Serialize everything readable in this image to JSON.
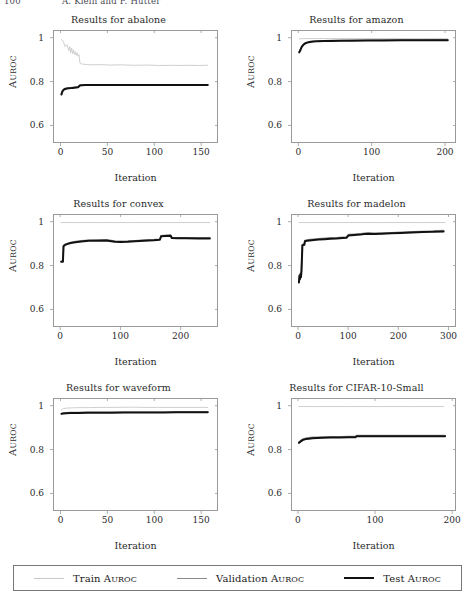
{
  "page": {
    "folio": "100",
    "running_head": "A. Klein and F. Hutter"
  },
  "legend": {
    "entries": [
      {
        "label": "Train AUROC",
        "color": "#c9c9c9",
        "width": 0.9
      },
      {
        "label": "Validation AUROC",
        "color": "#8a8a8a",
        "width": 1.5
      },
      {
        "label": "Test AUROC",
        "color": "#111111",
        "width": 2.0
      }
    ]
  },
  "chart_data": [
    {
      "type": "line",
      "title": "Results for abalone",
      "xlabel": "Iteration",
      "ylabel": "AUROC",
      "xlim": [
        -8,
        168
      ],
      "ylim": [
        0.52,
        1.035
      ],
      "xticks": [
        0,
        50,
        100,
        150
      ],
      "yticks": [
        0.6,
        0.8,
        1
      ],
      "ytick_labels": [
        "0.6",
        "0.8",
        "1"
      ],
      "grid": false,
      "series": [
        {
          "name": "Train AUROC",
          "color": "#c9c9c9",
          "width": 0.9,
          "x": [
            0,
            2,
            4,
            6,
            8,
            9,
            10,
            11,
            12,
            13,
            14,
            15,
            16,
            17,
            18,
            19,
            20,
            21,
            22,
            24,
            28,
            34,
            42,
            52,
            64,
            78,
            92,
            106,
            118,
            128,
            138,
            148,
            158
          ],
          "y": [
            0.995,
            0.988,
            0.962,
            0.972,
            0.944,
            0.962,
            0.935,
            0.955,
            0.93,
            0.948,
            0.926,
            0.94,
            0.922,
            0.934,
            0.918,
            0.925,
            0.886,
            0.884,
            0.882,
            0.881,
            0.879,
            0.878,
            0.879,
            0.877,
            0.878,
            0.876,
            0.877,
            0.875,
            0.876,
            0.875,
            0.876,
            0.875,
            0.876
          ]
        },
        {
          "name": "Validation AUROC",
          "color": "#8a8a8a",
          "width": 1.5,
          "x": [
            0,
            1,
            2,
            3,
            4,
            6,
            8,
            10,
            12,
            14,
            16,
            18,
            20,
            22,
            26,
            32,
            40,
            52,
            66,
            82,
            100,
            118,
            136,
            158
          ],
          "y": [
            0.742,
            0.756,
            0.762,
            0.766,
            0.768,
            0.77,
            0.771,
            0.772,
            0.773,
            0.774,
            0.775,
            0.776,
            0.784,
            0.785,
            0.785,
            0.786,
            0.786,
            0.786,
            0.786,
            0.786,
            0.786,
            0.786,
            0.786,
            0.786
          ]
        },
        {
          "name": "Test AUROC",
          "color": "#111111",
          "width": 2.0,
          "x": [
            0,
            1,
            2,
            3,
            4,
            6,
            8,
            10,
            12,
            14,
            16,
            18,
            20,
            22,
            26,
            32,
            40,
            52,
            66,
            82,
            100,
            118,
            136,
            158
          ],
          "y": [
            0.74,
            0.754,
            0.76,
            0.764,
            0.766,
            0.768,
            0.769,
            0.77,
            0.771,
            0.772,
            0.773,
            0.774,
            0.782,
            0.783,
            0.784,
            0.784,
            0.784,
            0.784,
            0.784,
            0.784,
            0.784,
            0.784,
            0.784,
            0.784
          ]
        }
      ]
    },
    {
      "type": "line",
      "title": "Results for amazon",
      "xlabel": "Iteration",
      "ylabel": "AUROC",
      "xlim": [
        -10,
        215
      ],
      "ylim": [
        0.52,
        1.035
      ],
      "xticks": [
        0,
        100,
        200
      ],
      "yticks": [
        0.6,
        0.8,
        1
      ],
      "ytick_labels": [
        "0.6",
        "0.8",
        "1"
      ],
      "grid": false,
      "series": [
        {
          "name": "Train AUROC",
          "color": "#c9c9c9",
          "width": 0.9,
          "x": [
            0,
            4,
            10,
            20,
            40,
            80,
            120,
            160,
            205
          ],
          "y": [
            0.999,
            0.999,
            1.0,
            1.0,
            1.0,
            1.0,
            1.0,
            1.0,
            1.0
          ]
        },
        {
          "name": "Validation AUROC",
          "color": "#8a8a8a",
          "width": 1.5,
          "x": [
            0,
            1,
            2,
            3,
            4,
            6,
            8,
            11,
            15,
            20,
            26,
            34,
            44,
            58,
            74,
            94,
            116,
            140,
            166,
            190,
            205
          ],
          "y": [
            0.938,
            0.944,
            0.952,
            0.96,
            0.966,
            0.974,
            0.979,
            0.983,
            0.986,
            0.988,
            0.989,
            0.99,
            0.991,
            0.991,
            0.992,
            0.992,
            0.993,
            0.993,
            0.993,
            0.994,
            0.994
          ]
        },
        {
          "name": "Test AUROC",
          "color": "#111111",
          "width": 2.0,
          "x": [
            0,
            1,
            2,
            3,
            4,
            6,
            8,
            11,
            15,
            20,
            26,
            34,
            44,
            58,
            74,
            94,
            116,
            140,
            166,
            190,
            205
          ],
          "y": [
            0.936,
            0.942,
            0.95,
            0.958,
            0.964,
            0.972,
            0.977,
            0.981,
            0.984,
            0.986,
            0.988,
            0.989,
            0.989,
            0.99,
            0.99,
            0.991,
            0.991,
            0.992,
            0.992,
            0.992,
            0.992
          ]
        }
      ]
    },
    {
      "type": "line",
      "title": "Results for convex",
      "xlabel": "Iteration",
      "ylabel": "AUROC",
      "xlim": [
        -12,
        262
      ],
      "ylim": [
        0.52,
        1.035
      ],
      "xticks": [
        0,
        100,
        200
      ],
      "yticks": [
        0.6,
        0.8,
        1
      ],
      "ytick_labels": [
        "0.6",
        "0.8",
        "1"
      ],
      "grid": false,
      "series": [
        {
          "name": "Train AUROC",
          "color": "#c9c9c9",
          "width": 0.9,
          "x": [
            0,
            20,
            60,
            120,
            180,
            250
          ],
          "y": [
            1.0,
            1.0,
            1.0,
            1.0,
            1.0,
            1.0
          ]
        },
        {
          "name": "Validation AUROC",
          "color": "#8a8a8a",
          "width": 1.5,
          "x": [
            0,
            3,
            4,
            6,
            10,
            16,
            24,
            34,
            46,
            60,
            76,
            90,
            100,
            112,
            124,
            140,
            156,
            166,
            168,
            176,
            184,
            186,
            196,
            210,
            230,
            250
          ],
          "y": [
            0.82,
            0.82,
            0.893,
            0.898,
            0.903,
            0.908,
            0.912,
            0.915,
            0.918,
            0.919,
            0.92,
            0.914,
            0.913,
            0.914,
            0.916,
            0.919,
            0.921,
            0.923,
            0.939,
            0.941,
            0.942,
            0.931,
            0.93,
            0.93,
            0.929,
            0.929
          ]
        },
        {
          "name": "Test AUROC",
          "color": "#111111",
          "width": 2.0,
          "x": [
            0,
            3,
            4,
            6,
            10,
            16,
            24,
            34,
            46,
            60,
            76,
            90,
            100,
            112,
            124,
            140,
            156,
            166,
            168,
            176,
            184,
            186,
            196,
            210,
            230,
            250
          ],
          "y": [
            0.818,
            0.818,
            0.89,
            0.895,
            0.9,
            0.905,
            0.909,
            0.912,
            0.915,
            0.916,
            0.917,
            0.911,
            0.91,
            0.911,
            0.913,
            0.916,
            0.918,
            0.92,
            0.936,
            0.938,
            0.939,
            0.928,
            0.927,
            0.927,
            0.926,
            0.926
          ]
        }
      ]
    },
    {
      "type": "line",
      "title": "Results for madelon",
      "xlabel": "Iteration",
      "ylabel": "AUROC",
      "xlim": [
        -14,
        315
      ],
      "ylim": [
        0.52,
        1.035
      ],
      "xticks": [
        0,
        100,
        200,
        300
      ],
      "yticks": [
        0.6,
        0.8,
        1
      ],
      "ytick_labels": [
        "0.6",
        "0.8",
        "1"
      ],
      "grid": false,
      "series": [
        {
          "name": "Train AUROC",
          "color": "#c9c9c9",
          "width": 0.9,
          "x": [
            0,
            20,
            80,
            160,
            240,
            295
          ],
          "y": [
            1.0,
            1.0,
            1.0,
            1.0,
            1.0,
            1.0
          ]
        },
        {
          "name": "Validation AUROC",
          "color": "#8a8a8a",
          "width": 1.5,
          "x": [
            0,
            1,
            2,
            3,
            4,
            5,
            7,
            9,
            11,
            12,
            16,
            22,
            30,
            40,
            52,
            64,
            76,
            88,
            96,
            100,
            112,
            124,
            132,
            140,
            152,
            168,
            186,
            206,
            228,
            250,
            272,
            292
          ],
          "y": [
            0.728,
            0.758,
            0.742,
            0.766,
            0.752,
            0.774,
            0.898,
            0.9,
            0.901,
            0.917,
            0.919,
            0.921,
            0.923,
            0.925,
            0.927,
            0.929,
            0.93,
            0.932,
            0.933,
            0.944,
            0.946,
            0.948,
            0.95,
            0.951,
            0.95,
            0.951,
            0.953,
            0.955,
            0.957,
            0.959,
            0.961,
            0.963
          ]
        },
        {
          "name": "Test AUROC",
          "color": "#111111",
          "width": 2.0,
          "x": [
            0,
            1,
            2,
            3,
            4,
            5,
            7,
            9,
            11,
            12,
            16,
            22,
            30,
            40,
            52,
            64,
            76,
            88,
            96,
            100,
            112,
            124,
            132,
            140,
            152,
            168,
            186,
            206,
            228,
            250,
            272,
            292
          ],
          "y": [
            0.722,
            0.752,
            0.736,
            0.76,
            0.746,
            0.77,
            0.894,
            0.896,
            0.897,
            0.913,
            0.915,
            0.917,
            0.919,
            0.921,
            0.923,
            0.925,
            0.926,
            0.928,
            0.929,
            0.94,
            0.942,
            0.944,
            0.947,
            0.948,
            0.947,
            0.948,
            0.95,
            0.952,
            0.954,
            0.956,
            0.957,
            0.959
          ]
        }
      ]
    },
    {
      "type": "line",
      "title": "Results for waveform",
      "xlabel": "Iteration",
      "ylabel": "AUROC",
      "xlim": [
        -8,
        168
      ],
      "ylim": [
        0.52,
        1.035
      ],
      "xticks": [
        0,
        50,
        100,
        150
      ],
      "yticks": [
        0.6,
        0.8,
        1
      ],
      "ytick_labels": [
        "0.6",
        "0.8",
        "1"
      ],
      "grid": false,
      "series": [
        {
          "name": "Train AUROC",
          "color": "#c9c9c9",
          "width": 0.9,
          "x": [
            0,
            2,
            6,
            12,
            20,
            30,
            42,
            56,
            70,
            80,
            90,
            104,
            118,
            132,
            146,
            158
          ],
          "y": [
            0.985,
            0.99,
            0.993,
            0.994,
            0.995,
            0.995,
            0.996,
            0.996,
            0.997,
            0.997,
            0.996,
            0.996,
            0.996,
            0.996,
            0.996,
            0.996
          ]
        },
        {
          "name": "Validation AUROC",
          "color": "#8a8a8a",
          "width": 1.5,
          "x": [
            0,
            2,
            5,
            10,
            18,
            28,
            40,
            54,
            68,
            82,
            96,
            110,
            124,
            138,
            150,
            158
          ],
          "y": [
            0.968,
            0.97,
            0.971,
            0.972,
            0.972,
            0.973,
            0.973,
            0.973,
            0.974,
            0.974,
            0.974,
            0.974,
            0.975,
            0.975,
            0.975,
            0.975
          ]
        },
        {
          "name": "Test AUROC",
          "color": "#111111",
          "width": 2.0,
          "x": [
            0,
            2,
            5,
            10,
            18,
            28,
            40,
            54,
            68,
            82,
            96,
            110,
            124,
            138,
            150,
            158
          ],
          "y": [
            0.966,
            0.968,
            0.969,
            0.97,
            0.97,
            0.971,
            0.971,
            0.971,
            0.972,
            0.972,
            0.972,
            0.972,
            0.973,
            0.973,
            0.973,
            0.973
          ]
        }
      ]
    },
    {
      "type": "line",
      "title": "Results for CIFAR-10-Small",
      "xlabel": "Iteration",
      "ylabel": "AUROC",
      "xlim": [
        -9,
        205
      ],
      "ylim": [
        0.52,
        1.035
      ],
      "xticks": [
        0,
        100,
        200
      ],
      "yticks": [
        0.6,
        0.8,
        1
      ],
      "ytick_labels": [
        "0.6",
        "0.8",
        "1"
      ],
      "grid": false,
      "series": [
        {
          "name": "Train AUROC",
          "color": "#c9c9c9",
          "width": 0.9,
          "x": [
            0,
            20,
            60,
            110,
            150,
            190
          ],
          "y": [
            1.0,
            1.0,
            1.0,
            1.0,
            1.0,
            1.0
          ]
        },
        {
          "name": "Validation AUROC",
          "color": "#8a8a8a",
          "width": 1.5,
          "x": [
            0,
            1,
            2,
            4,
            6,
            9,
            13,
            18,
            24,
            32,
            42,
            54,
            66,
            74,
            76,
            84,
            96,
            110,
            126,
            144,
            162,
            180,
            192
          ],
          "y": [
            0.835,
            0.838,
            0.841,
            0.846,
            0.85,
            0.853,
            0.855,
            0.857,
            0.858,
            0.859,
            0.86,
            0.86,
            0.861,
            0.861,
            0.866,
            0.866,
            0.866,
            0.866,
            0.866,
            0.866,
            0.866,
            0.866,
            0.866
          ]
        },
        {
          "name": "Test AUROC",
          "color": "#111111",
          "width": 2.0,
          "x": [
            0,
            1,
            2,
            4,
            6,
            9,
            13,
            18,
            24,
            32,
            42,
            54,
            66,
            74,
            76,
            84,
            96,
            110,
            126,
            144,
            162,
            180,
            192
          ],
          "y": [
            0.831,
            0.834,
            0.837,
            0.842,
            0.846,
            0.849,
            0.851,
            0.853,
            0.854,
            0.855,
            0.856,
            0.856,
            0.857,
            0.857,
            0.862,
            0.862,
            0.862,
            0.862,
            0.862,
            0.862,
            0.862,
            0.862,
            0.862
          ]
        }
      ]
    }
  ]
}
